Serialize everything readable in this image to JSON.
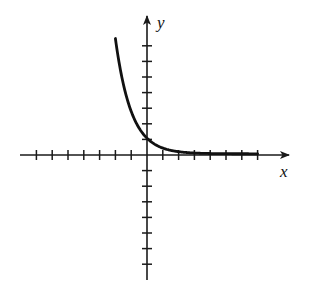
{
  "chart_data": {
    "type": "line",
    "title": "",
    "function": "y = e^(-x)",
    "xlabel": "x",
    "ylabel": "y",
    "x_ticks": [
      -7,
      -6,
      -5,
      -4,
      -3,
      -2,
      -1,
      1,
      2,
      3,
      4,
      5,
      6,
      7
    ],
    "y_ticks": [
      -7,
      -6,
      -5,
      -4,
      -3,
      -2,
      -1,
      1,
      2,
      3,
      4,
      5,
      6,
      7
    ],
    "tick_labels_shown": false,
    "xlim": [
      -8,
      8.8
    ],
    "ylim": [
      -8,
      8.7
    ],
    "grid": false,
    "legend": null,
    "series": [
      {
        "name": "curve",
        "x_range": [
          -2.0,
          7.0
        ],
        "points": [
          {
            "x": -2.0,
            "y": 7.39
          },
          {
            "x": -1.5,
            "y": 4.48
          },
          {
            "x": -1.0,
            "y": 2.72
          },
          {
            "x": -0.5,
            "y": 1.65
          },
          {
            "x": 0.0,
            "y": 1.0
          },
          {
            "x": 0.5,
            "y": 0.61
          },
          {
            "x": 1.0,
            "y": 0.37
          },
          {
            "x": 2.0,
            "y": 0.14
          },
          {
            "x": 3.0,
            "y": 0.05
          },
          {
            "x": 4.0,
            "y": 0.02
          },
          {
            "x": 5.0,
            "y": 0.01
          },
          {
            "x": 6.0,
            "y": 0.0
          },
          {
            "x": 7.0,
            "y": 0.0
          }
        ]
      }
    ]
  },
  "style": {
    "axis_color": "#1a1a1a",
    "curve_color": "#111111",
    "background": "#ffffff"
  },
  "layout": {
    "origin_px": [
      147,
      155
    ],
    "unit_px_x": 15.8,
    "unit_px_y": 15.6,
    "x_axis_px": [
      20,
      289
    ],
    "y_axis_px": [
      16,
      280
    ]
  }
}
